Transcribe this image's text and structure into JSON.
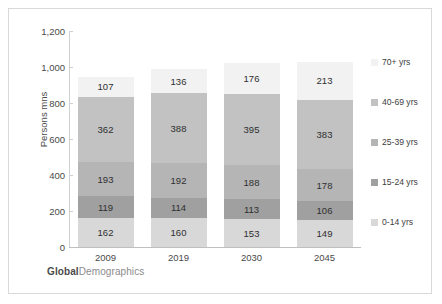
{
  "footer": {
    "brand_strong": "Global",
    "brand_rest": "Demographics"
  },
  "chart_data": {
    "type": "bar",
    "stacked": true,
    "title": "",
    "xlabel": "",
    "ylabel": "Persons mns",
    "ylim": [
      0,
      1200
    ],
    "ytick_step": 200,
    "yticks": [
      "0",
      "200",
      "400",
      "600",
      "800",
      "1,000",
      "1,200"
    ],
    "grid": false,
    "legend_position": "right",
    "categories": [
      "2009",
      "2019",
      "2030",
      "2045"
    ],
    "series": [
      {
        "name": "0-14 yrs",
        "color": "#d8d8d8",
        "values": [
          162,
          160,
          153,
          149
        ]
      },
      {
        "name": "15-24 yrs",
        "color": "#a0a0a0",
        "values": [
          119,
          114,
          113,
          106
        ]
      },
      {
        "name": "25-39 yrs",
        "color": "#b5b5b5",
        "values": [
          193,
          192,
          188,
          178
        ]
      },
      {
        "name": "40-69 yrs",
        "color": "#c2c2c2",
        "values": [
          362,
          388,
          395,
          383
        ]
      },
      {
        "name": "70+ yrs",
        "color": "#f2f2f2",
        "values": [
          107,
          136,
          176,
          213
        ]
      }
    ],
    "legend_order": [
      "70+ yrs",
      "40-69 yrs",
      "25-39 yrs",
      "15-24 yrs",
      "0-14 yrs"
    ],
    "totals": [
      943,
      990,
      1025,
      1029
    ]
  }
}
